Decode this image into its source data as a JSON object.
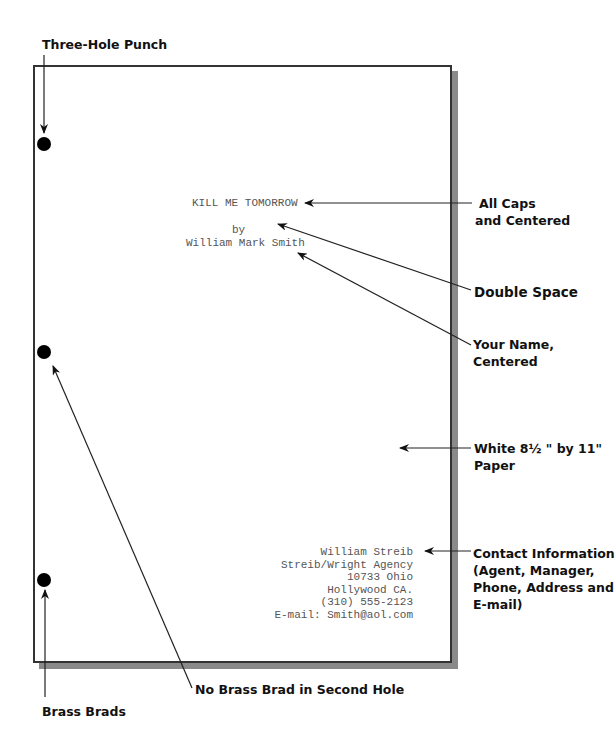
{
  "annotations": {
    "three_hole_punch": "Three-Hole Punch",
    "all_caps": [
      "All Caps",
      "and Centered"
    ],
    "double_space": "Double Space",
    "your_name": [
      "Your Name,",
      "Centered"
    ],
    "paper": [
      "White 8½ \" by 11\"",
      "Paper"
    ],
    "contact": [
      "Contact Information",
      "(Agent, Manager,",
      "Phone, Address and",
      "E-mail)"
    ],
    "no_brad": "No Brass Brad in Second Hole",
    "brass_brads": "Brass Brads"
  },
  "page": {
    "title": "KILL ME TOMORROW",
    "by": "by",
    "author": "William Mark Smith",
    "contact_lines": [
      "William Streib",
      "Streib/Wright Agency",
      "10733 Ohio",
      "Hollywood CA.",
      "(310) 555-2123",
      "E-mail: Smith@aol.com"
    ]
  },
  "colors": {
    "paper_border": "#333333",
    "shadow": "#8a8a8a",
    "text": "#555555",
    "label": "#111111"
  }
}
